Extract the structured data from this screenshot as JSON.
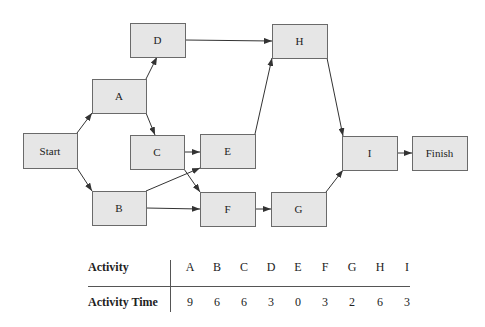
{
  "diagram": {
    "type": "activity-on-node network",
    "nodes": [
      {
        "id": "Start",
        "label": "Start",
        "x": 23,
        "y": 133,
        "w": 54,
        "h": 35
      },
      {
        "id": "A",
        "label": "A",
        "x": 92,
        "y": 79,
        "w": 54,
        "h": 34
      },
      {
        "id": "B",
        "label": "B",
        "x": 92,
        "y": 191,
        "w": 54,
        "h": 34
      },
      {
        "id": "C",
        "label": "C",
        "x": 130,
        "y": 135,
        "w": 54,
        "h": 34
      },
      {
        "id": "D",
        "label": "D",
        "x": 130,
        "y": 23,
        "w": 55,
        "h": 34
      },
      {
        "id": "E",
        "label": "E",
        "x": 200,
        "y": 134,
        "w": 55,
        "h": 34
      },
      {
        "id": "F",
        "label": "F",
        "x": 200,
        "y": 192,
        "w": 55,
        "h": 34
      },
      {
        "id": "G",
        "label": "G",
        "x": 271,
        "y": 192,
        "w": 55,
        "h": 34
      },
      {
        "id": "H",
        "label": "H",
        "x": 272,
        "y": 24,
        "w": 55,
        "h": 34
      },
      {
        "id": "I",
        "label": "I",
        "x": 342,
        "y": 136,
        "w": 55,
        "h": 34
      },
      {
        "id": "Finish",
        "label": "Finish",
        "x": 412,
        "y": 136,
        "w": 55,
        "h": 34
      }
    ],
    "edges": [
      {
        "from": "Start",
        "to": "A",
        "x1": 77,
        "y1": 133,
        "x2": 92,
        "y2": 113
      },
      {
        "from": "Start",
        "to": "B",
        "x1": 77,
        "y1": 168,
        "x2": 92,
        "y2": 191
      },
      {
        "from": "A",
        "to": "D",
        "x1": 146,
        "y1": 79,
        "x2": 157,
        "y2": 57
      },
      {
        "from": "A",
        "to": "C",
        "x1": 146,
        "y1": 113,
        "x2": 155,
        "y2": 135
      },
      {
        "from": "D",
        "to": "H",
        "x1": 185,
        "y1": 40,
        "x2": 272,
        "y2": 41
      },
      {
        "from": "C",
        "to": "E",
        "x1": 184,
        "y1": 152,
        "x2": 200,
        "y2": 152
      },
      {
        "from": "C",
        "to": "F",
        "x1": 184,
        "y1": 169,
        "x2": 200,
        "y2": 192
      },
      {
        "from": "B",
        "to": "E",
        "x1": 146,
        "y1": 191,
        "x2": 200,
        "y2": 168
      },
      {
        "from": "B",
        "to": "F",
        "x1": 146,
        "y1": 208,
        "x2": 200,
        "y2": 209
      },
      {
        "from": "E",
        "to": "H",
        "x1": 255,
        "y1": 134,
        "x2": 272,
        "y2": 58
      },
      {
        "from": "F",
        "to": "G",
        "x1": 255,
        "y1": 209,
        "x2": 271,
        "y2": 209
      },
      {
        "from": "H",
        "to": "I",
        "x1": 327,
        "y1": 58,
        "x2": 343,
        "y2": 136
      },
      {
        "from": "G",
        "to": "I",
        "x1": 326,
        "y1": 192,
        "x2": 343,
        "y2": 170
      },
      {
        "from": "I",
        "to": "Finish",
        "x1": 397,
        "y1": 153,
        "x2": 412,
        "y2": 153
      }
    ],
    "colors": {
      "node_fill": "#e6e6e6",
      "node_stroke": "#6a6a6a",
      "edge": "#333333"
    }
  },
  "table": {
    "row_labels": [
      "Activity",
      "Activity Time"
    ],
    "activities": [
      "A",
      "B",
      "C",
      "D",
      "E",
      "F",
      "G",
      "H",
      "I"
    ],
    "times": [
      "9",
      "6",
      "6",
      "3",
      "0",
      "3",
      "2",
      "6",
      "3"
    ],
    "column_x": [
      190,
      217,
      244,
      271,
      298,
      325,
      352,
      380,
      407
    ]
  }
}
